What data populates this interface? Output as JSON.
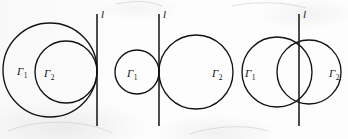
{
  "figure": {
    "width": 348,
    "height": 139,
    "ink_color": "#121212",
    "background_color": "#fdfdfd",
    "panels": [
      {
        "id": "panel-internally-tangent",
        "caption": "Internally tangent circles with common tangent line",
        "line_label": "l",
        "line": {
          "x": 97,
          "y_top": 14,
          "y_bottom": 126
        },
        "circles": [
          {
            "name": "gamma-1",
            "label": "Γ",
            "subscript": "1",
            "cx": 50,
            "cy": 70,
            "r": 47,
            "label_x": 17,
            "label_y": 66
          },
          {
            "name": "gamma-2",
            "label": "Γ",
            "subscript": "2",
            "cx": 66,
            "cy": 72,
            "r": 31,
            "label_x": 44,
            "label_y": 68
          }
        ]
      },
      {
        "id": "panel-externally-tangent",
        "caption": "Externally tangent circles with common tangent line",
        "line_label": "l",
        "line": {
          "x": 159,
          "y_top": 14,
          "y_bottom": 126
        },
        "circles": [
          {
            "name": "gamma-1",
            "label": "Γ",
            "subscript": "1",
            "cx": 137,
            "cy": 72,
            "r": 22,
            "label_x": 127,
            "label_y": 68
          },
          {
            "name": "gamma-2",
            "label": "Γ",
            "subscript": "2",
            "cx": 196,
            "cy": 72,
            "r": 37,
            "label_x": 212,
            "label_y": 68
          }
        ]
      },
      {
        "id": "panel-intersecting",
        "caption": "Intersecting circles with line through both intersection points",
        "line_label": "l",
        "line": {
          "x": 299,
          "y_top": 14,
          "y_bottom": 126
        },
        "circles": [
          {
            "name": "gamma-1",
            "label": "Γ",
            "subscript": "1",
            "cx": 277,
            "cy": 72,
            "r": 35,
            "label_x": 245,
            "label_y": 68
          },
          {
            "name": "gamma-2",
            "label": "Γ",
            "subscript": "2",
            "cx": 309,
            "cy": 72,
            "r": 32,
            "label_x": 329,
            "label_y": 68
          }
        ]
      }
    ]
  }
}
